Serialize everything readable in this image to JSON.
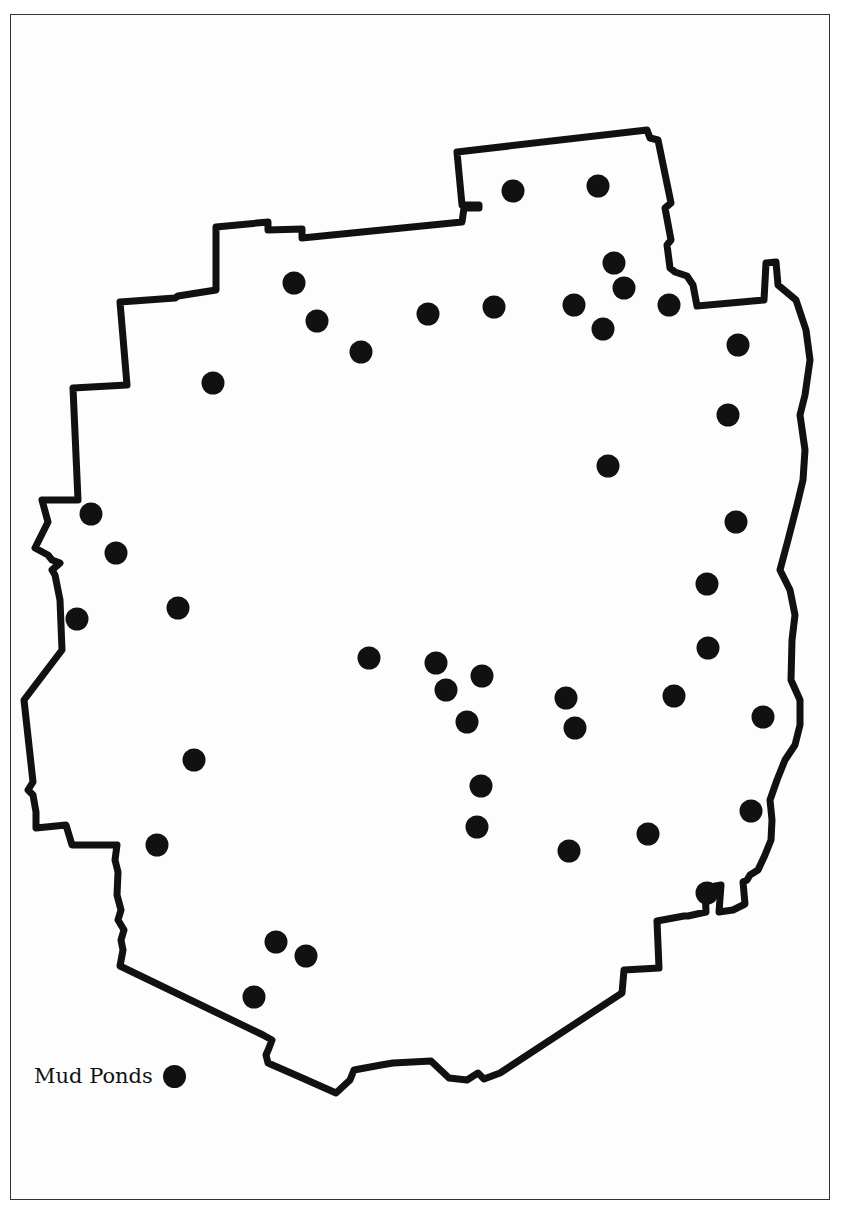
{
  "map": {
    "boundary_color": "#111111",
    "pond_color": "#111111",
    "legend": {
      "label": "Mud Ponds"
    },
    "ponds": [
      [
        513,
        191
      ],
      [
        598,
        186
      ],
      [
        614,
        263
      ],
      [
        624,
        288
      ],
      [
        669,
        305
      ],
      [
        574,
        305
      ],
      [
        603,
        329
      ],
      [
        494,
        307
      ],
      [
        428,
        314
      ],
      [
        294,
        283
      ],
      [
        317,
        321
      ],
      [
        361,
        352
      ],
      [
        213,
        383
      ],
      [
        738,
        345
      ],
      [
        728,
        415
      ],
      [
        608,
        466
      ],
      [
        91,
        514
      ],
      [
        116,
        553
      ],
      [
        736,
        522
      ],
      [
        178,
        608
      ],
      [
        77,
        619
      ],
      [
        707,
        584
      ],
      [
        708,
        648
      ],
      [
        369,
        658
      ],
      [
        436,
        663
      ],
      [
        482,
        676
      ],
      [
        446,
        690
      ],
      [
        566,
        698
      ],
      [
        674,
        696
      ],
      [
        467,
        722
      ],
      [
        575,
        728
      ],
      [
        763,
        717
      ],
      [
        194,
        760
      ],
      [
        481,
        786
      ],
      [
        751,
        811
      ],
      [
        477,
        827
      ],
      [
        157,
        845
      ],
      [
        569,
        851
      ],
      [
        648,
        834
      ],
      [
        707,
        893
      ],
      [
        276,
        942
      ],
      [
        306,
        956
      ],
      [
        254,
        997
      ]
    ]
  }
}
